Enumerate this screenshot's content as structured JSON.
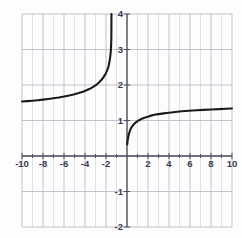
{
  "chart_data": {
    "type": "line",
    "title": "",
    "subtitle": "",
    "xlabel": "",
    "ylabel": "",
    "xlim": [
      -10,
      10
    ],
    "ylim": [
      -2,
      4
    ],
    "grid": true,
    "minor_grid": true,
    "legend": null,
    "legend_position": "none",
    "x_ticks": [
      -10,
      -8,
      -6,
      -4,
      -2,
      2,
      4,
      6,
      8,
      10
    ],
    "x_tick_labels": [
      "-10",
      "-8",
      "-6",
      "-4",
      "-2",
      "2",
      "4",
      "6",
      "8",
      "10"
    ],
    "y_ticks": [
      4,
      3,
      2,
      1,
      -1,
      -2
    ],
    "y_tick_labels": [
      "4",
      "3",
      "2",
      "1",
      "-1",
      "-2"
    ],
    "x_minor_step": 1,
    "y_minor_step": 1,
    "x_major_step": 2,
    "y_major_step": 1,
    "curve_color": "#1a1a1a",
    "grid_color": "#b9bcc9",
    "minor_grid_color": "#cfd2dc",
    "axis_color": "#6e7180",
    "asymptotes": {
      "vertical": -1.4,
      "horizontal": 1.35
    },
    "series": [
      {
        "name": "left-branch",
        "x": [
          -10.0,
          -9.5,
          -9.0,
          -8.5,
          -8.0,
          -7.5,
          -7.0,
          -6.5,
          -6.0,
          -5.5,
          -5.0,
          -4.6,
          -4.2,
          -3.9,
          -3.6,
          -3.3,
          -3.0,
          -2.8,
          -2.6,
          -2.4,
          -2.25,
          -2.1,
          -2.0,
          -1.9,
          -1.82,
          -1.75,
          -1.7,
          -1.65,
          -1.6,
          -1.57,
          -1.54,
          -1.52,
          -1.5,
          -1.49,
          -1.48
        ],
        "y": [
          1.535,
          1.545,
          1.558,
          1.572,
          1.588,
          1.605,
          1.625,
          1.648,
          1.674,
          1.704,
          1.74,
          1.772,
          1.81,
          1.845,
          1.885,
          1.932,
          1.99,
          2.035,
          2.09,
          2.155,
          2.215,
          2.285,
          2.34,
          2.405,
          2.47,
          2.54,
          2.61,
          2.69,
          2.79,
          2.87,
          2.97,
          3.07,
          3.22,
          3.42,
          4.0
        ]
      },
      {
        "name": "right-branch",
        "x": [
          0.02,
          0.06,
          0.12,
          0.2,
          0.3,
          0.42,
          0.55,
          0.7,
          0.9,
          1.1,
          1.35,
          1.6,
          1.9,
          2.2,
          2.6,
          3.0,
          3.5,
          4.0,
          4.6,
          5.2,
          5.9,
          6.6,
          7.3,
          8.0,
          8.8,
          9.4,
          10.0
        ],
        "y": [
          0.33,
          0.44,
          0.54,
          0.64,
          0.73,
          0.8,
          0.86,
          0.91,
          0.96,
          1.0,
          1.04,
          1.07,
          1.1,
          1.13,
          1.16,
          1.18,
          1.2,
          1.22,
          1.24,
          1.26,
          1.275,
          1.29,
          1.3,
          1.31,
          1.32,
          1.33,
          1.34
        ]
      }
    ]
  }
}
